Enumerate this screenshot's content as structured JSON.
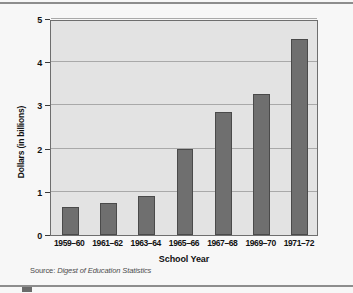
{
  "chart_data": {
    "type": "bar",
    "title": "",
    "xlabel": "School Year",
    "ylabel": "Dollars (in billions)",
    "categories": [
      "1959–60",
      "1961–62",
      "1963–64",
      "1965–66",
      "1967–68",
      "1969–70",
      "1971–72"
    ],
    "values": [
      0.65,
      0.75,
      0.91,
      2.0,
      2.84,
      3.27,
      4.53
    ],
    "ylim": [
      0,
      5
    ],
    "yticks": [
      0,
      1,
      2,
      3,
      4,
      5
    ],
    "ytick_labels": [
      "0",
      "1",
      "2",
      "3",
      "4",
      "5"
    ],
    "grid": true,
    "legend": null,
    "series_color": "#6f6f6f",
    "panel_color": "#e3e3e3"
  },
  "source": {
    "prefix": "Source:",
    "title": "Digest of Education Statistics"
  }
}
